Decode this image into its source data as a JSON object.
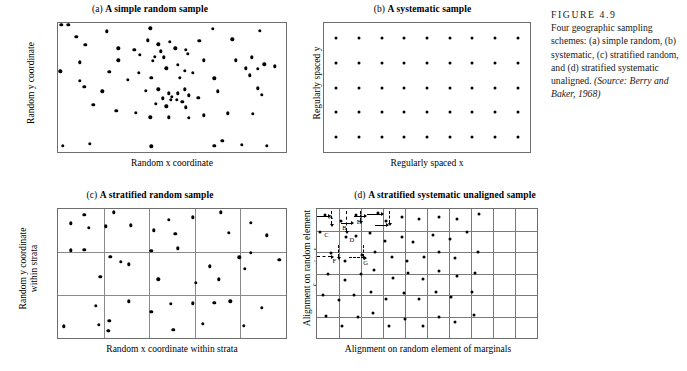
{
  "figure": {
    "number_label": "FIGURE 4.9",
    "caption_body": "Four geographic sampling schemes: (a) simple random, (b) systematic, (c) stratified random, and (d) stratified systematic unaligned.",
    "source": "(Source: Berry and Baker, 1968)"
  },
  "panels": {
    "a": {
      "tag": "(a)",
      "title": "A simple random sample",
      "xlabel": "Random x coordinate",
      "ylabel": "Random y coordinate"
    },
    "b": {
      "tag": "(b)",
      "title": "A systematic sample",
      "xlabel": "Regularly spaced x",
      "ylabel": "Regularly spaced y"
    },
    "c": {
      "tag": "(c)",
      "title": "A stratified random sample",
      "xlabel": "Random x coordinate within strata",
      "ylabel_line1": "Random y coordinate",
      "ylabel_line2": "within strata"
    },
    "d": {
      "tag": "(d)",
      "title": "A stratified systematic unaligned sample",
      "xlabel": "Alignment on random element of marginals",
      "ylabel_line1": "Alignment on random element",
      "ylabel_line2": "of marginals"
    }
  },
  "colors": {
    "dot": "#000000",
    "box_border": "#6e6e6e",
    "grid_line": "#8a8a8a",
    "background": "#ffffff",
    "text": "#111111"
  },
  "chart_data": [
    {
      "id": "a",
      "type": "scatter",
      "title": "(a) A simple random sample",
      "xlabel": "Random x coordinate",
      "ylabel": "Random y coordinate",
      "xlim": [
        0,
        100
      ],
      "ylim": [
        0,
        100
      ],
      "grid": false,
      "n_points": 78,
      "points": [
        [
          1.5,
          98.5
        ],
        [
          4.5,
          98.5
        ],
        [
          8.0,
          89.5
        ],
        [
          21.5,
          93.5
        ],
        [
          40.5,
          96.0
        ],
        [
          68.0,
          95.5
        ],
        [
          88.5,
          94.0
        ],
        [
          12.0,
          83.0
        ],
        [
          26.5,
          80.5
        ],
        [
          39.5,
          86.5
        ],
        [
          44.0,
          83.5
        ],
        [
          49.0,
          85.5
        ],
        [
          51.5,
          80.5
        ],
        [
          45.0,
          78.0
        ],
        [
          33.5,
          79.0
        ],
        [
          36.0,
          75.5
        ],
        [
          42.5,
          74.0
        ],
        [
          46.5,
          73.5
        ],
        [
          56.0,
          79.0
        ],
        [
          62.0,
          86.0
        ],
        [
          76.5,
          87.5
        ],
        [
          9.5,
          69.5
        ],
        [
          26.5,
          71.0
        ],
        [
          41.5,
          70.5
        ],
        [
          52.5,
          67.5
        ],
        [
          57.0,
          76.0
        ],
        [
          64.0,
          71.0
        ],
        [
          78.0,
          71.0
        ],
        [
          85.0,
          73.5
        ],
        [
          90.5,
          68.0
        ],
        [
          1.0,
          62.5
        ],
        [
          22.5,
          62.0
        ],
        [
          35.5,
          61.5
        ],
        [
          47.5,
          65.0
        ],
        [
          55.5,
          63.0
        ],
        [
          82.5,
          65.0
        ],
        [
          87.5,
          64.5
        ],
        [
          95.0,
          66.5
        ],
        [
          9.5,
          55.0
        ],
        [
          11.5,
          50.5
        ],
        [
          30.5,
          56.0
        ],
        [
          41.0,
          57.5
        ],
        [
          53.5,
          57.5
        ],
        [
          59.0,
          61.5
        ],
        [
          68.5,
          57.0
        ],
        [
          84.0,
          59.5
        ],
        [
          19.5,
          47.0
        ],
        [
          38.5,
          47.5
        ],
        [
          44.0,
          48.5
        ],
        [
          48.5,
          45.5
        ],
        [
          50.0,
          43.0
        ],
        [
          52.5,
          45.5
        ],
        [
          55.5,
          48.5
        ],
        [
          57.5,
          44.0
        ],
        [
          46.0,
          41.5
        ],
        [
          49.5,
          40.5
        ],
        [
          52.0,
          40.5
        ],
        [
          54.5,
          39.0
        ],
        [
          43.0,
          37.5
        ],
        [
          47.5,
          35.5
        ],
        [
          56.0,
          34.5
        ],
        [
          61.5,
          42.0
        ],
        [
          70.0,
          47.0
        ],
        [
          87.5,
          49.5
        ],
        [
          89.5,
          44.5
        ],
        [
          15.5,
          36.5
        ],
        [
          25.5,
          32.0
        ],
        [
          34.0,
          30.5
        ],
        [
          40.5,
          27.0
        ],
        [
          48.5,
          27.0
        ],
        [
          57.5,
          26.5
        ],
        [
          64.0,
          28.5
        ],
        [
          74.5,
          30.0
        ],
        [
          85.5,
          29.5
        ],
        [
          2.0,
          5.0
        ],
        [
          14.0,
          6.5
        ],
        [
          41.0,
          4.5
        ],
        [
          68.5,
          5.0
        ],
        [
          72.0,
          8.5
        ],
        [
          80.5,
          5.5
        ],
        [
          91.5,
          5.0
        ]
      ]
    },
    {
      "id": "b",
      "type": "scatter",
      "title": "(b) A systematic sample",
      "xlabel": "Regularly spaced x",
      "ylabel": "Regularly spaced y",
      "xlim": [
        0,
        100
      ],
      "ylim": [
        0,
        100
      ],
      "grid": false,
      "lattice": {
        "rows": 5,
        "cols": 9,
        "x_start": 6,
        "x_step": 11,
        "y_start": 12,
        "y_step": 19
      },
      "n_points": 45
    },
    {
      "id": "c",
      "type": "scatter",
      "title": "(c) A stratified random sample",
      "xlabel": "Random x coordinate within strata",
      "ylabel": "Random y coordinate within strata",
      "xlim": [
        0,
        100
      ],
      "ylim": [
        0,
        100
      ],
      "grid": true,
      "strata_cols": 5,
      "strata_rows": 3,
      "n_points": 45,
      "points": [
        [
          5.5,
          89.0
        ],
        [
          11.5,
          95.5
        ],
        [
          13.5,
          85.5
        ],
        [
          24.5,
          97.5
        ],
        [
          21.0,
          86.5
        ],
        [
          32.0,
          87.5
        ],
        [
          42.0,
          83.5
        ],
        [
          48.5,
          91.5
        ],
        [
          51.5,
          81.0
        ],
        [
          59.0,
          93.5
        ],
        [
          71.5,
          97.5
        ],
        [
          84.5,
          89.5
        ],
        [
          75.0,
          81.5
        ],
        [
          91.5,
          79.5
        ],
        [
          5.5,
          68.0
        ],
        [
          11.5,
          68.5
        ],
        [
          23.0,
          63.0
        ],
        [
          27.5,
          59.0
        ],
        [
          31.0,
          57.0
        ],
        [
          18.5,
          47.5
        ],
        [
          41.0,
          67.5
        ],
        [
          52.5,
          69.5
        ],
        [
          44.0,
          45.5
        ],
        [
          60.5,
          43.0
        ],
        [
          66.5,
          55.5
        ],
        [
          70.5,
          45.5
        ],
        [
          79.5,
          62.5
        ],
        [
          84.5,
          66.0
        ],
        [
          82.0,
          53.5
        ],
        [
          97.0,
          60.5
        ],
        [
          2.5,
          9.0
        ],
        [
          16.5,
          25.0
        ],
        [
          18.0,
          10.0
        ],
        [
          22.5,
          13.5
        ],
        [
          22.0,
          5.5
        ],
        [
          31.0,
          28.5
        ],
        [
          41.0,
          20.5
        ],
        [
          49.5,
          26.5
        ],
        [
          50.5,
          6.5
        ],
        [
          59.0,
          27.0
        ],
        [
          63.5,
          11.0
        ],
        [
          68.5,
          27.5
        ],
        [
          75.5,
          28.5
        ],
        [
          81.5,
          9.5
        ],
        [
          89.5,
          23.5
        ]
      ]
    },
    {
      "id": "d",
      "type": "scatter",
      "title": "(d) A stratified systematic unaligned sample",
      "xlabel": "Alignment on random element of marginals",
      "ylabel": "Alignment on random element of marginals",
      "xlim": [
        0,
        100
      ],
      "ylim": [
        0,
        100
      ],
      "grid": true,
      "grid_cols": 10,
      "grid_rows": 6,
      "n_points": 60,
      "points": [
        [
          3.5,
          95.5
        ],
        [
          11.0,
          91.0
        ],
        [
          17.5,
          95.5
        ],
        [
          27.5,
          97.0
        ],
        [
          31.5,
          91.0
        ],
        [
          38.5,
          93.5
        ],
        [
          46.5,
          92.0
        ],
        [
          55.5,
          94.0
        ],
        [
          63.5,
          92.5
        ],
        [
          73.5,
          96.5
        ],
        [
          1.5,
          82.0
        ],
        [
          13.0,
          78.0
        ],
        [
          17.5,
          79.0
        ],
        [
          24.0,
          81.5
        ],
        [
          31.0,
          75.0
        ],
        [
          38.5,
          78.0
        ],
        [
          43.5,
          74.5
        ],
        [
          52.5,
          79.5
        ],
        [
          60.5,
          77.0
        ],
        [
          68.0,
          82.0
        ],
        [
          6.5,
          66.0
        ],
        [
          12.5,
          60.0
        ],
        [
          20.5,
          64.0
        ],
        [
          26.5,
          66.5
        ],
        [
          34.0,
          63.0
        ],
        [
          41.0,
          59.5
        ],
        [
          48.5,
          62.5
        ],
        [
          55.5,
          66.5
        ],
        [
          62.5,
          62.0
        ],
        [
          73.0,
          66.5
        ],
        [
          5.0,
          50.0
        ],
        [
          12.5,
          45.0
        ],
        [
          20.0,
          49.5
        ],
        [
          26.0,
          52.5
        ],
        [
          34.5,
          46.5
        ],
        [
          41.5,
          50.5
        ],
        [
          48.0,
          45.5
        ],
        [
          55.5,
          52.0
        ],
        [
          63.5,
          48.0
        ],
        [
          72.0,
          50.5
        ],
        [
          2.5,
          33.5
        ],
        [
          10.0,
          29.5
        ],
        [
          17.0,
          33.5
        ],
        [
          24.5,
          36.0
        ],
        [
          31.5,
          30.0
        ],
        [
          39.5,
          34.5
        ],
        [
          46.5,
          30.5
        ],
        [
          54.0,
          35.5
        ],
        [
          61.0,
          32.0
        ],
        [
          70.5,
          35.5
        ],
        [
          4.0,
          17.0
        ],
        [
          11.5,
          9.5
        ],
        [
          18.5,
          16.0
        ],
        [
          25.5,
          19.5
        ],
        [
          32.5,
          9.0
        ],
        [
          40.0,
          15.0
        ],
        [
          48.0,
          9.5
        ],
        [
          55.5,
          16.5
        ],
        [
          62.5,
          12.5
        ],
        [
          71.5,
          17.5
        ]
      ],
      "annotations": [
        {
          "label": "A",
          "x": 3.5,
          "y": 95.5
        },
        {
          "label": "B",
          "x": 11.0,
          "y": 91.0
        },
        {
          "label": "C",
          "x": 1.5,
          "y": 82.0
        },
        {
          "label": "D",
          "x": 13.0,
          "y": 78.0
        },
        {
          "label": "E",
          "x": 17.5,
          "y": 95.5
        },
        {
          "label": "F",
          "x": 6.5,
          "y": 66.0
        },
        {
          "label": "G",
          "x": 20.5,
          "y": 64.0
        }
      ]
    }
  ]
}
